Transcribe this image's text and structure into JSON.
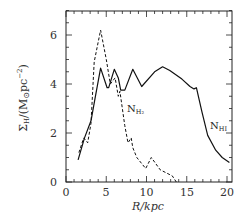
{
  "chart_data": {
    "type": "line",
    "title": "",
    "xlabel": "R/kpc",
    "ylabel": "Σ_H/(M⊙pc⁻²)",
    "xlim": [
      0,
      20.6
    ],
    "ylim": [
      0,
      7
    ],
    "xticks": [
      0,
      5,
      10,
      15,
      20
    ],
    "yticks": [
      0,
      2,
      4,
      6
    ],
    "grid": false,
    "legend": "inline labels",
    "series": [
      {
        "name": "N_HI",
        "style": "solid",
        "label_sub": "HI",
        "x": [
          1.5,
          2.3,
          3.1,
          3.6,
          4.3,
          5.1,
          5.3,
          6.0,
          6.5,
          6.8,
          7.3,
          8.3,
          9.4,
          11.0,
          12.0,
          12.9,
          14.4,
          15.4,
          15.9,
          16.2,
          16.9,
          17.6,
          18.6,
          19.4,
          20.3
        ],
        "y": [
          0.9,
          1.8,
          2.5,
          3.4,
          4.65,
          3.85,
          3.85,
          4.6,
          4.25,
          3.75,
          3.75,
          4.6,
          3.9,
          4.5,
          4.7,
          4.55,
          4.2,
          3.9,
          3.8,
          3.85,
          2.85,
          1.9,
          1.3,
          1.0,
          0.8
        ]
      },
      {
        "name": "N_H2",
        "style": "dashed",
        "label_sub": "H₂",
        "x": [
          1.6,
          2.2,
          2.7,
          3.1,
          3.5,
          4.3,
          5.0,
          5.5,
          6.1,
          6.5,
          6.7,
          7.3,
          7.7,
          8.1,
          8.3,
          8.8,
          9.9,
          10.6,
          11.7,
          13.2,
          13.7
        ],
        "y": [
          1.2,
          1.8,
          1.6,
          2.4,
          4.9,
          6.2,
          5.0,
          4.0,
          4.25,
          3.5,
          3.7,
          2.3,
          1.6,
          1.8,
          1.4,
          1.0,
          0.55,
          1.0,
          0.5,
          0.25,
          0.0
        ]
      }
    ]
  },
  "labels": {
    "ytick_0": "0",
    "ytick_2": "2",
    "ytick_4": "4",
    "ytick_6": "6",
    "xtick_0": "0",
    "xtick_5": "5",
    "xtick_10": "10",
    "xtick_15": "15",
    "xtick_20": "20",
    "xlabel": "R/kpc",
    "ylabel_main": "Σ",
    "ylabel_sub": "H",
    "ylabel_rest": "/(M",
    "ylabel_sun": "⊙",
    "ylabel_unit": "pc",
    "ylabel_exp": "−2",
    "ylabel_close": ")",
    "nh2_main": "N",
    "nh2_sub": "H₂",
    "nhi_main": "N",
    "nhi_sub": "HI"
  }
}
